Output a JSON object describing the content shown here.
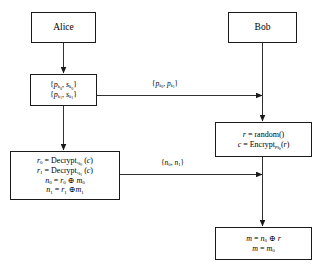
{
  "diagram": {
    "background_color": "#ffffff",
    "line_color": "#1a1a1a",
    "text_color": "#000000"
  },
  "actors": {
    "alice": "Alice",
    "bob": "Bob"
  },
  "alice_steps": [
    {
      "id": "keypairs",
      "lines": [
        "{p_k0, s_k0}",
        "{p_k1, s_k1}"
      ]
    },
    {
      "id": "decrypt",
      "lines": [
        "r_0 = Decrypt_s_k0 (c)",
        "r_1 = Decrypt_s_k1 (c)",
        "n_0 = r_0 ⊕ m_0",
        "n_1 = r_1 ⊕ m_1"
      ]
    }
  ],
  "bob_steps": [
    {
      "id": "randomize",
      "lines": [
        "r = random()",
        "c = Encrypt_p_kb (r)"
      ]
    },
    {
      "id": "recover",
      "lines": [
        "m = n_0 ⊕ r",
        "m = m_0"
      ]
    }
  ],
  "messages": [
    {
      "id": "public-keys",
      "label": "{p_k0, p_k1}",
      "direction": "alice-to-bob"
    },
    {
      "id": "nonces",
      "label": "{n_0, n_1}",
      "direction": "alice-to-bob"
    }
  ],
  "symbols": {
    "xor": "⊕",
    "open_brace": "{",
    "close_brace": "}"
  }
}
